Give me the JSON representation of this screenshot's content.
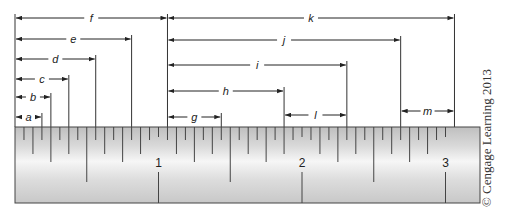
{
  "figure": {
    "credit": "© Cengage Learning 2013",
    "colors": {
      "line": "#222222",
      "ruler_edge": "#444444",
      "ruler_light": "#f4f4f4",
      "ruler_dark": "#c4c4c4"
    }
  },
  "ruler": {
    "units": "inches",
    "divisions_per_inch": 16,
    "length_in": 3.0,
    "origin_px": 15,
    "px_per_inch": 143.5,
    "top_px": 127,
    "bottom_px": 203,
    "inch_labels": [
      "1",
      "2",
      "3"
    ]
  },
  "dimensions": [
    {
      "label": "a",
      "start_in": 0.0,
      "end_in": 0.1875,
      "y": 117
    },
    {
      "label": "b",
      "start_in": 0.0,
      "end_in": 0.25,
      "y": 97
    },
    {
      "label": "c",
      "start_in": 0.0,
      "end_in": 0.375,
      "y": 79
    },
    {
      "label": "d",
      "start_in": 0.0,
      "end_in": 0.5625,
      "y": 59
    },
    {
      "label": "e",
      "start_in": 0.0,
      "end_in": 0.8125,
      "y": 39
    },
    {
      "label": "f",
      "start_in": 0.0,
      "end_in": 1.0625,
      "y": 18
    },
    {
      "label": "g",
      "start_in": 1.0625,
      "end_in": 1.4375,
      "y": 117
    },
    {
      "label": "h",
      "start_in": 1.0625,
      "end_in": 1.875,
      "y": 91
    },
    {
      "label": "i",
      "start_in": 1.0625,
      "end_in": 2.3125,
      "y": 65
    },
    {
      "label": "j",
      "start_in": 1.0625,
      "end_in": 2.6875,
      "y": 40
    },
    {
      "label": "k",
      "start_in": 1.0625,
      "end_in": 3.0625,
      "y": 18
    },
    {
      "label": "l",
      "start_in": 1.875,
      "end_in": 2.3125,
      "y": 115
    },
    {
      "label": "m",
      "start_in": 2.6875,
      "end_in": 3.0625,
      "y": 111
    }
  ]
}
